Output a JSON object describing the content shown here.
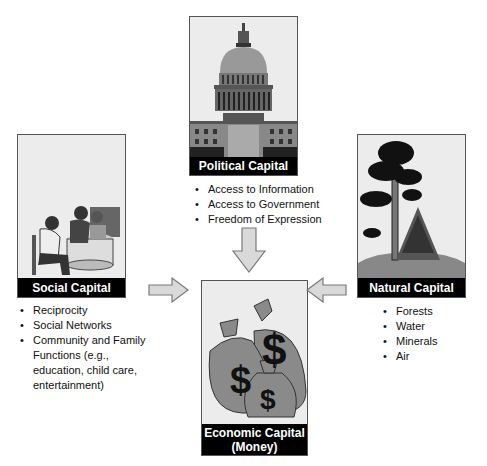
{
  "nodes": {
    "political": {
      "label": "Political Capital",
      "image": "capitol-building",
      "items": [
        "Access to Information",
        "Access to Government",
        "Freedom of Expression"
      ]
    },
    "social": {
      "label": "Social Capital",
      "image": "family-at-table",
      "items": [
        "Reciprocity",
        "Social Networks",
        "Community and Family Functions (e.g., education, child care, entertainment)"
      ]
    },
    "natural": {
      "label": "Natural Capital",
      "image": "trees",
      "items": [
        "Forests",
        "Water",
        "Minerals",
        "Air"
      ]
    },
    "economic": {
      "label_line1": "Economic Capital",
      "label_line2": "(Money)",
      "image": "money-bags",
      "bag_symbol": "$"
    }
  },
  "edges": [
    {
      "from": "political",
      "to": "economic",
      "direction": "down"
    },
    {
      "from": "social",
      "to": "economic",
      "direction": "right"
    },
    {
      "from": "natural",
      "to": "economic",
      "direction": "left"
    }
  ],
  "colors": {
    "arrow_fill": "#d9d9d9",
    "arrow_stroke": "#7a7a7a",
    "label_bar": "#000000"
  }
}
